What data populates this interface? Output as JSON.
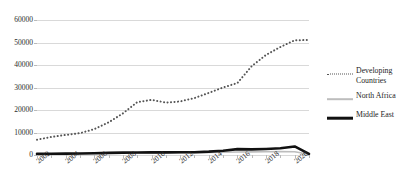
{
  "chart_data": {
    "type": "line",
    "title": "",
    "subtitle": "",
    "xlabel": "",
    "ylabel": "",
    "grid": true,
    "legend_position": "right",
    "ylim": [
      0,
      60000
    ],
    "ytick_labels": [
      "0",
      "10000",
      "20000",
      "30000",
      "40000",
      "50000",
      "60000"
    ],
    "ytick_values": [
      0,
      10000,
      20000,
      30000,
      40000,
      50000,
      60000
    ],
    "xtick_labels": [
      "2002",
      "2004",
      "2006",
      "2008",
      "2010",
      "2012",
      "2014",
      "2016",
      "2018",
      "2020"
    ],
    "x": [
      2002,
      2003,
      2004,
      2005,
      2006,
      2007,
      2008,
      2009,
      2010,
      2011,
      2012,
      2013,
      2014,
      2015,
      2016,
      2017,
      2018,
      2019,
      2020,
      2021
    ],
    "xlim": [
      2002,
      2021
    ],
    "series": [
      {
        "name": "Developing Countries",
        "style": "dotted",
        "color": "#555555",
        "values": [
          6800,
          8000,
          8900,
          9700,
          11500,
          14500,
          18500,
          23500,
          24500,
          23300,
          23800,
          25300,
          27600,
          30000,
          32000,
          39500,
          44500,
          48000,
          51000,
          51100
        ]
      },
      {
        "name": "North Africa",
        "style": "solid-thin",
        "color": "#bdbdbd",
        "values": [
          400,
          450,
          500,
          550,
          650,
          750,
          850,
          900,
          950,
          950,
          1000,
          1050,
          1100,
          1200,
          1350,
          1400,
          1450,
          1500,
          1450,
          300
        ]
      },
      {
        "name": "Middle East",
        "style": "solid-thick",
        "color": "#111111",
        "values": [
          500,
          550,
          600,
          700,
          800,
          950,
          1050,
          1100,
          1150,
          1150,
          1200,
          1250,
          1500,
          1900,
          2600,
          2500,
          2700,
          3000,
          3800,
          500
        ]
      }
    ]
  },
  "legend": {
    "entries": [
      {
        "label": "Developing\nCountries",
        "marker": "dotted-line-icon"
      },
      {
        "label": "North Africa",
        "marker": "gray-line-icon"
      },
      {
        "label": "Middle East",
        "marker": "black-line-icon"
      }
    ]
  }
}
